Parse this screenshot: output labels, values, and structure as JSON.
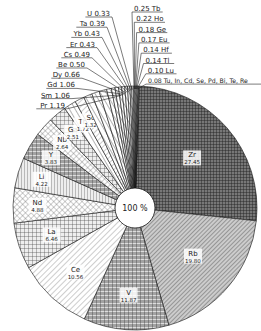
{
  "chart_data": {
    "type": "pie",
    "title": "",
    "center_label": "100 %",
    "unit": "%",
    "slices": [
      {
        "label": "Zr",
        "value": 27.45
      },
      {
        "label": "Rb",
        "value": 19.8
      },
      {
        "label": "V",
        "value": 11.87
      },
      {
        "label": "Ce",
        "value": 10.56
      },
      {
        "label": "La",
        "value": 6.46
      },
      {
        "label": "Nd",
        "value": 4.88
      },
      {
        "label": "Li",
        "value": 4.22
      },
      {
        "label": "Y",
        "value": 3.83
      },
      {
        "label": "Nb",
        "value": 2.64
      },
      {
        "label": "Ga",
        "value": 2.51
      },
      {
        "label": "Th",
        "value": 1.72
      },
      {
        "label": "Sc",
        "value": 1.32
      },
      {
        "label": "Pr",
        "value": 1.19
      },
      {
        "label": "Sm",
        "value": 1.06
      },
      {
        "label": "Gd",
        "value": 1.06
      },
      {
        "label": "Dy",
        "value": 0.66
      },
      {
        "label": "Be",
        "value": 0.5
      },
      {
        "label": "Cs",
        "value": 0.49
      },
      {
        "label": "Er",
        "value": 0.43
      },
      {
        "label": "Yb",
        "value": 0.43
      },
      {
        "label": "Ta",
        "value": 0.39
      },
      {
        "label": "U",
        "value": 0.33
      },
      {
        "label": "Tb",
        "value": 0.25
      },
      {
        "label": "Ho",
        "value": 0.22
      },
      {
        "label": "Ge",
        "value": 0.18
      },
      {
        "label": "Eu",
        "value": 0.17
      },
      {
        "label": "Hf",
        "value": 0.14
      },
      {
        "label": "Tl",
        "value": 0.14
      },
      {
        "label": "Lu",
        "value": 0.1
      },
      {
        "label": "Tu, In, Cd, Se, Pd, Bi, Te, Re",
        "value": 0.08
      }
    ],
    "left_callouts": [
      "U 0.33",
      "Ta 0.39",
      "Yb 0.43",
      "Er 0.43",
      "Cs 0.49",
      "Be 0.50",
      "Dy 0.66",
      "Gd 1.06",
      "Sm 1.06",
      "Pr 1.19"
    ],
    "right_callouts": [
      "0.25 Tb",
      "0.22 Ho",
      "0.18 Ge",
      "0.17 Eu",
      "0.14 Hf",
      "0.14 Tl",
      "0.10 Lu",
      "0.08 Tu, In, Cd, Se, Pd, Bi, Te, Re"
    ]
  }
}
